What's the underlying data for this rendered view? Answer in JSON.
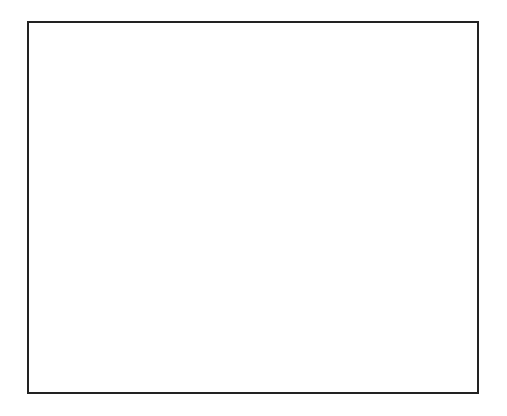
{
  "chart_data": {
    "type": "bar",
    "orientation": "horizontal",
    "xlabel": "Number of volunteers",
    "ylabel": "Age of volunteers",
    "categories": [
      "65 and over",
      "55-64",
      "45-54",
      "35-44",
      "25-34",
      "19-24",
      "18 or under"
    ],
    "series": [
      {
        "name": "Male",
        "fill": "#111111",
        "pattern": "solid",
        "values": [
          10,
          3,
          2,
          3,
          1,
          1,
          1
        ]
      },
      {
        "name": "Female",
        "fill": "#ffffff",
        "pattern": "diagonal-hatch",
        "values": [
          9,
          12,
          6,
          0,
          3,
          5,
          2
        ]
      }
    ],
    "xlim": [
      0,
      12
    ],
    "xticks": [
      0,
      2,
      4,
      6,
      8,
      10,
      12
    ],
    "reference_line": {
      "x": 4,
      "style": "dotted"
    },
    "grid": false,
    "legend_position": "top-right"
  },
  "ylabel_letters": [
    "A",
    "g",
    "e",
    "",
    "o",
    "f",
    "",
    "v",
    "o",
    "l",
    "u",
    "n",
    "t",
    "e",
    "e",
    "r",
    "s"
  ],
  "legend": {
    "male": "Male",
    "female": "Female"
  },
  "xlabel": "Number of volunteers"
}
